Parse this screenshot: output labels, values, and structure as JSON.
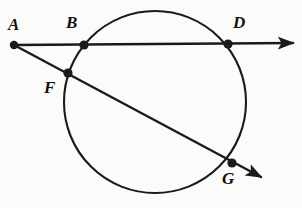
{
  "figure": {
    "kind": "geometry-diagram",
    "background_color": "#fbfbfa",
    "stroke_color": "#1a1a1a",
    "label_color": "#111111"
  },
  "circle": {
    "name": "circle",
    "cx": 155,
    "cy": 102,
    "r": 91,
    "stroke_width": 2.1,
    "fill": "none"
  },
  "rays": [
    {
      "name": "ray-ABD",
      "from": "A",
      "through": [
        "B",
        "D"
      ],
      "x1": 14,
      "y1": 45,
      "x2": 293,
      "y2": 43,
      "stroke_width": 2.4,
      "arrow": true
    },
    {
      "name": "ray-AFG",
      "from": "A",
      "through": [
        "F",
        "G"
      ],
      "x1": 14,
      "y1": 45,
      "x2": 261,
      "y2": 177,
      "stroke_width": 2.4,
      "arrow": true
    }
  ],
  "points": [
    {
      "id": "A",
      "label": "A",
      "x": 14,
      "y": 45,
      "label_x": 8,
      "label_y": 16,
      "dot_r": 4.2,
      "on_circle": false
    },
    {
      "id": "B",
      "label": "B",
      "x": 84,
      "y": 45,
      "label_x": 66,
      "label_y": 14,
      "dot_r": 4.6,
      "on_circle": true
    },
    {
      "id": "D",
      "label": "D",
      "x": 228,
      "y": 44,
      "label_x": 233,
      "label_y": 14,
      "dot_r": 4.6,
      "on_circle": true
    },
    {
      "id": "F",
      "label": "F",
      "x": 68,
      "y": 73,
      "label_x": 44,
      "label_y": 79,
      "dot_r": 4.6,
      "on_circle": true
    },
    {
      "id": "G",
      "label": "G",
      "x": 232,
      "y": 163,
      "label_x": 222,
      "label_y": 170,
      "dot_r": 4.6,
      "on_circle": true
    }
  ]
}
